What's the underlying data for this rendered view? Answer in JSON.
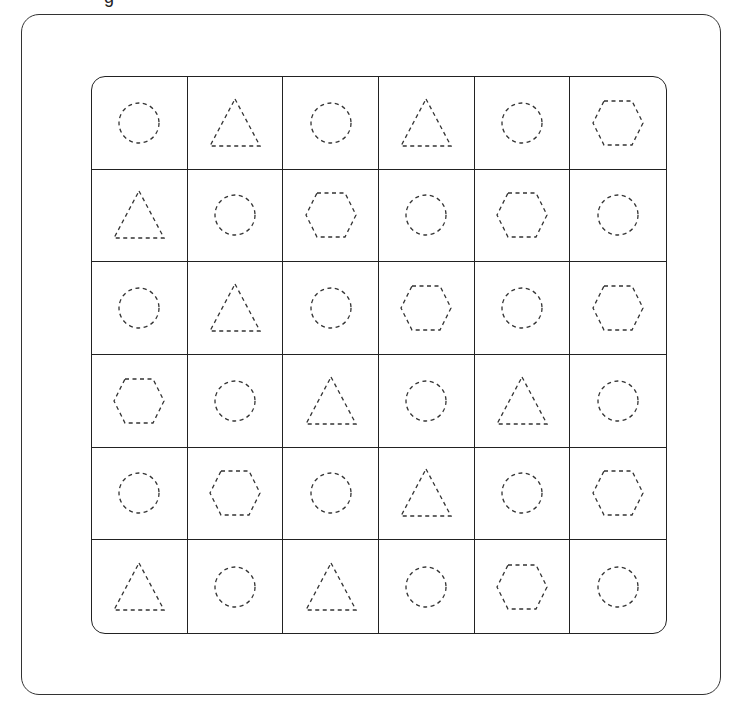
{
  "worksheet": {
    "top_cropped_text": "g",
    "grid": {
      "rows": 6,
      "cols": 6,
      "cells": [
        [
          "circle",
          "triangle",
          "circle",
          "triangle",
          "circle",
          "hexagon"
        ],
        [
          "triangle",
          "circle",
          "hexagon",
          "circle",
          "hexagon",
          "circle"
        ],
        [
          "circle",
          "triangle",
          "circle",
          "hexagon",
          "circle",
          "hexagon"
        ],
        [
          "hexagon",
          "circle",
          "triangle",
          "circle",
          "triangle",
          "circle"
        ],
        [
          "circle",
          "hexagon",
          "circle",
          "triangle",
          "circle",
          "hexagon"
        ],
        [
          "triangle",
          "circle",
          "triangle",
          "circle",
          "hexagon",
          "circle"
        ]
      ]
    },
    "style": {
      "line_color": "#222222",
      "dash_color": "#333333",
      "background": "#ffffff"
    }
  }
}
